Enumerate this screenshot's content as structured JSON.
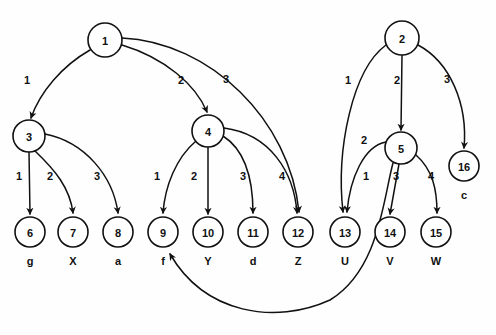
{
  "diagram": {
    "background_color": "#ffffff",
    "stroke_color": "#111111",
    "node_radius": 15,
    "nodes": [
      {
        "id": "n1",
        "label": "1",
        "cx": 105,
        "cy": 40,
        "r": 17,
        "leaf": null
      },
      {
        "id": "n2",
        "label": "2",
        "cx": 402,
        "cy": 38,
        "r": 17,
        "leaf": null
      },
      {
        "id": "n3",
        "label": "3",
        "cx": 29,
        "cy": 136,
        "r": 16,
        "leaf": null
      },
      {
        "id": "n4",
        "label": "4",
        "cx": 208,
        "cy": 131,
        "r": 16,
        "leaf": null
      },
      {
        "id": "n5",
        "label": "5",
        "cx": 401,
        "cy": 148,
        "r": 16,
        "leaf": null
      },
      {
        "id": "n6",
        "label": "6",
        "cx": 30,
        "cy": 232,
        "r": 15,
        "leaf": "g"
      },
      {
        "id": "n7",
        "label": "7",
        "cx": 73,
        "cy": 232,
        "r": 15,
        "leaf": "X"
      },
      {
        "id": "n8",
        "label": "8",
        "cx": 118,
        "cy": 232,
        "r": 15,
        "leaf": "a"
      },
      {
        "id": "n9",
        "label": "9",
        "cx": 163,
        "cy": 232,
        "r": 15,
        "leaf": "f"
      },
      {
        "id": "n10",
        "label": "10",
        "cx": 208,
        "cy": 232,
        "r": 15,
        "leaf": "Y"
      },
      {
        "id": "n11",
        "label": "11",
        "cx": 253,
        "cy": 232,
        "r": 15,
        "leaf": "d"
      },
      {
        "id": "n12",
        "label": "12",
        "cx": 298,
        "cy": 232,
        "r": 15,
        "leaf": "Z"
      },
      {
        "id": "n13",
        "label": "13",
        "cx": 345,
        "cy": 232,
        "r": 15,
        "leaf": "U"
      },
      {
        "id": "n14",
        "label": "14",
        "cx": 390,
        "cy": 232,
        "r": 15,
        "leaf": "V"
      },
      {
        "id": "n15",
        "label": "15",
        "cx": 436,
        "cy": 232,
        "r": 15,
        "leaf": "W"
      },
      {
        "id": "n16",
        "label": "16",
        "cx": 464,
        "cy": 166,
        "r": 15,
        "leaf": "c"
      }
    ],
    "edges": [
      {
        "from": "n1",
        "to": "n3",
        "label": "1",
        "lx": 27,
        "ly": 80,
        "path": "M 90 50 C 62 66 40 92 31 118"
      },
      {
        "from": "n1",
        "to": "n4",
        "label": "2",
        "lx": 181,
        "ly": 80,
        "path": "M 122 45 C 165 58 196 85 207 112"
      },
      {
        "from": "n1",
        "to": "n12",
        "label": "3",
        "lx": 226,
        "ly": 79,
        "path": "M 122 38 C 210 42 290 120 299 212"
      },
      {
        "from": "n3",
        "to": "n6",
        "label": "1",
        "lx": 19,
        "ly": 176,
        "path": "M 29 152 L 30 214"
      },
      {
        "from": "n3",
        "to": "n7",
        "label": "2",
        "lx": 50,
        "ly": 176,
        "path": "M 35 151 C 55 170 70 188 73 213"
      },
      {
        "from": "n3",
        "to": "n8",
        "label": "3",
        "lx": 97,
        "ly": 176,
        "path": "M 45 134 C 85 142 113 176 118 213"
      },
      {
        "from": "n4",
        "to": "n9",
        "label": "1",
        "lx": 157,
        "ly": 176,
        "path": "M 196 141 C 176 158 165 186 163 213"
      },
      {
        "from": "n4",
        "to": "n10",
        "label": "2",
        "lx": 194,
        "ly": 176,
        "path": "M 208 147 L 208 214"
      },
      {
        "from": "n4",
        "to": "n11",
        "label": "3",
        "lx": 243,
        "ly": 176,
        "path": "M 223 136 C 245 150 253 180 253 213"
      },
      {
        "from": "n4",
        "to": "n12",
        "label": "4",
        "lx": 282,
        "ly": 176,
        "path": "M 224 128 C 270 134 294 172 297 213"
      },
      {
        "from": "n2",
        "to": "n13",
        "label": "1",
        "lx": 348,
        "ly": 80,
        "path": "M 386 45 C 352 70 336 150 343 212"
      },
      {
        "from": "n2",
        "to": "n5",
        "label": "2",
        "lx": 397,
        "ly": 80,
        "path": "M 402 55 L 401 130"
      },
      {
        "from": "n2",
        "to": "n16",
        "label": "3",
        "lx": 447,
        "ly": 79,
        "path": "M 418 45 C 450 62 468 104 464 148"
      },
      {
        "from": "n5",
        "to": "n13",
        "label": "2",
        "lx": 364,
        "ly": 140,
        "path": "M 386 142 C 364 146 350 178 347 212"
      },
      {
        "from": "n5",
        "to": "n9",
        "label": "1",
        "lx": 366,
        "ly": 176,
        "path": "M 393 163 C 383 200 379 270 330 300 C 275 325 205 314 170 254"
      },
      {
        "from": "n5",
        "to": "n14",
        "label": "3",
        "lx": 396,
        "ly": 176,
        "path": "M 399 164 L 390 214"
      },
      {
        "from": "n5",
        "to": "n15",
        "label": "4",
        "lx": 431,
        "ly": 176,
        "path": "M 416 155 C 433 170 437 190 437 213"
      }
    ]
  }
}
